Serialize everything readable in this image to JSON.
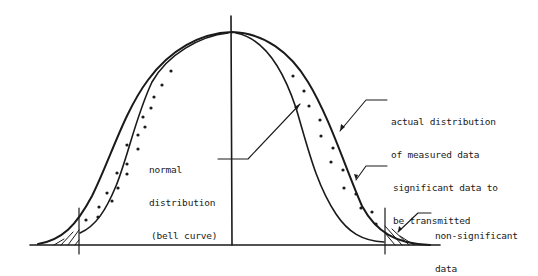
{
  "diagram": {
    "type": "bell-curve-annotation",
    "colors": {
      "stroke": "#1a1a1a",
      "background": "#ffffff"
    },
    "labels": {
      "actual": {
        "line1": "actual distribution",
        "line2": "of measured data"
      },
      "normal": {
        "line1": "normal",
        "line2": "distribution",
        "line3": "(bell curve)"
      },
      "significant": {
        "line1": "significant data to",
        "line2": "be transmitted"
      },
      "non_significant": {
        "line1": "non-significant",
        "line2": "data"
      }
    },
    "elements": [
      "baseline-axis",
      "center-vertical-line",
      "outer-curve-actual-distribution",
      "inner-curve-normal-distribution",
      "dotted-band-significant-data",
      "left-cutoff-line",
      "right-cutoff-line",
      "hatched-tails-non-significant-data"
    ]
  }
}
